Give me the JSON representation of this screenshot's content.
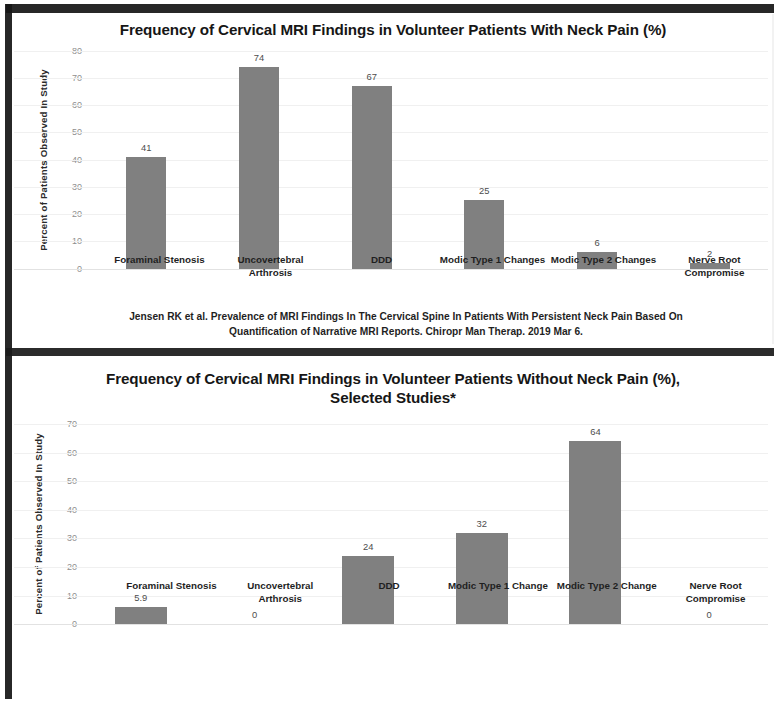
{
  "document": {
    "kind": "scanned-slide-with-two-bar-charts"
  },
  "chart_data": [
    {
      "type": "bar",
      "title": "Frequency of Cervical MRI Findings in Volunteer Patients With Neck Pain (%)",
      "xlabel": "",
      "ylabel": "Percent of Patients Observed In Study",
      "ylim": [
        0,
        80
      ],
      "yticks": [
        "0",
        "10",
        "20",
        "30",
        "40",
        "50",
        "60",
        "70",
        "80"
      ],
      "grid": true,
      "legend": "none",
      "bar_color": "#808080",
      "categories": [
        "Foraminal Stenosis",
        "Uncovertebral Arthrosis",
        "DDD",
        "Modic Type 1 Changes",
        "Modic Type 2 Changes",
        "Nerve Root Compromise"
      ],
      "values": [
        41,
        74,
        67,
        25,
        6,
        2
      ],
      "value_labels": [
        "41",
        "74",
        "67",
        "25",
        "6",
        "2"
      ],
      "annotation": "Jensen RK et al.  Prevalence of MRI Findings In The Cervical Spine In Patients With Persistent Neck Pain Based On Quantification of Narrative MRI Reports.  Chiropr Man Therap.  2019 Mar 6."
    },
    {
      "type": "bar",
      "title": "Frequency of Cervical MRI Findings in Volunteer Patients  Without Neck Pain (%), Selected Studies*",
      "xlabel": "",
      "ylabel": "Percent of Patients Observed In Study",
      "ylim": [
        0,
        70
      ],
      "yticks": [
        "0",
        "10",
        "20",
        "30",
        "40",
        "50",
        "60",
        "70"
      ],
      "grid": true,
      "legend": "none",
      "bar_color": "#808080",
      "categories": [
        "Foraminal Stenosis",
        "Uncovertebral Arthrosis",
        "DDD",
        "Modic Type 1 Change",
        "Modic Type 2 Change",
        "Nerve Root Compromise"
      ],
      "values": [
        5.9,
        0,
        24,
        32,
        64,
        0
      ],
      "value_labels": [
        "5.9",
        "0",
        "24",
        "32",
        "64",
        "0"
      ],
      "annotation": ""
    }
  ]
}
